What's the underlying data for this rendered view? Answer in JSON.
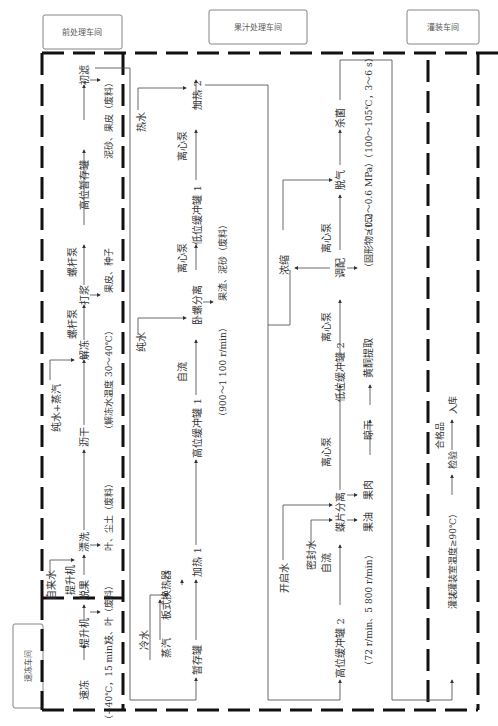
{
  "workshops": {
    "quick_freeze": "速冻车间",
    "pre_process": "前处理车间",
    "juice_process": "果汁处理车间",
    "filling": "灌装车间"
  },
  "freeze_section": {
    "steps": [
      "速冻",
      "提升机",
      "脱果"
    ],
    "note": "（−40℃，15 min）",
    "waste": "枝、叶（废料）"
  },
  "pre_process_section": {
    "inputs": {
      "tap_water": "自来水",
      "pure_water_steam": "纯水+蒸汽"
    },
    "steps": [
      "提升机",
      "漂洗",
      "沥干",
      "解冻",
      "螺杆泵",
      "打浆",
      "螺杆泵",
      "高位暂存罐",
      "初滤"
    ],
    "washing_waste": "叶、尘土（废料）",
    "thaw_note": "（解冻水温度 30～40℃）",
    "pulping_waste": "果皮、种子",
    "filter_waste": "泥砂、果皮（废料）"
  },
  "juice_section": {
    "inputs": {
      "cold_water": "冷水",
      "steam": "蒸汽",
      "pure_water": "纯水",
      "hot_water": "热水"
    },
    "steps": [
      "暂存罐",
      "板式换热器",
      "加热 1",
      "高位缓冲罐 1",
      "自流",
      "卧螺分离",
      "离心泵",
      "低位缓冲罐 1",
      "离心泵",
      "加热 2"
    ],
    "decanter_note": "（900～1 100 r/min）",
    "decanter_waste": "果渣、泥砂（废料）",
    "second_line": {
      "inputs": {
        "boil_water": "开启水",
        "seal_water": "密封水"
      },
      "steps": [
        "高位缓冲罐 2",
        "自流",
        "蝶片分离",
        "离心泵",
        "低位缓冲罐 2",
        "离心泵",
        "调配",
        "离心泵",
        "脱气",
        "杀菌"
      ],
      "disc_note": "（72 r/min、5 800 r/min）",
      "outputs": [
        "果油",
        "果肉"
      ],
      "pulp_steps": [
        "晾干",
        "黄酮提取"
      ],
      "concentrate": "浓缩",
      "blend_note": "（固形物≥15）",
      "sterilize_note": "（0.2～0.6 MPa）（100～105℃，3～6 s）"
    }
  },
  "filling_section": {
    "steps": [
      "灌装",
      "检验",
      "入库"
    ],
    "fill_note": "（灌装室温度≥90℃）",
    "pass_label": "合格品"
  }
}
